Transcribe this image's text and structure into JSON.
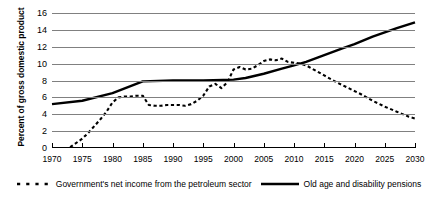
{
  "chart_data": {
    "type": "line",
    "title": "",
    "subtitle": "",
    "xlabel": "",
    "ylabel": "Percent of gross domestic product",
    "xlim": [
      1970,
      2030
    ],
    "ylim": [
      0,
      16
    ],
    "ytick_step": 2,
    "xtick_step": 5,
    "grid": true,
    "grid_axis": "y",
    "legend_position": "bottom",
    "xticks": [
      1970,
      1975,
      1980,
      1985,
      1990,
      1995,
      2000,
      2005,
      2010,
      2015,
      2020,
      2025,
      2030
    ],
    "yticks": [
      0,
      2,
      4,
      6,
      8,
      10,
      12,
      14,
      16
    ],
    "series": [
      {
        "name": "Government's net income from the petroleum sector",
        "style": "dashed",
        "color": "#000000",
        "x": [
          1973,
          1975,
          1976,
          1977,
          1978,
          1979,
          1980,
          1981,
          1982,
          1983,
          1984,
          1985,
          1986,
          1987,
          1988,
          1989,
          1990,
          1991,
          1992,
          1993,
          1994,
          1995,
          1996,
          1997,
          1998,
          1999,
          2000,
          2001,
          2002,
          2003,
          2004,
          2005,
          2006,
          2007,
          2008,
          2009,
          2010,
          2011,
          2012,
          2013,
          2015,
          2017,
          2019,
          2021,
          2023,
          2025,
          2027,
          2029,
          2030
        ],
        "y": [
          0.1,
          1.1,
          1.8,
          2.6,
          3.4,
          4.3,
          5.4,
          6.0,
          6.1,
          6.1,
          6.2,
          6.2,
          5.1,
          5.0,
          5.0,
          5.1,
          5.1,
          5.1,
          5.0,
          5.2,
          5.6,
          6.2,
          7.3,
          7.6,
          7.1,
          7.8,
          9.3,
          9.6,
          9.3,
          9.4,
          9.8,
          10.3,
          10.5,
          10.4,
          10.6,
          10.2,
          10.1,
          10.0,
          9.8,
          9.4,
          8.6,
          7.8,
          7.1,
          6.4,
          5.6,
          4.9,
          4.3,
          3.7,
          3.5
        ]
      },
      {
        "name": "Old age and disability pensions",
        "style": "solid",
        "color": "#000000",
        "x": [
          1970,
          1975,
          1980,
          1985,
          1990,
          1995,
          2000,
          2002,
          2005,
          2008,
          2010,
          2012,
          2015,
          2018,
          2020,
          2023,
          2025,
          2027,
          2030
        ],
        "y": [
          5.2,
          5.6,
          6.5,
          7.9,
          8.0,
          8.0,
          8.1,
          8.3,
          8.8,
          9.4,
          9.8,
          10.2,
          11.0,
          11.8,
          12.3,
          13.2,
          13.7,
          14.2,
          14.9
        ]
      }
    ]
  },
  "legend": {
    "entries": [
      {
        "label": "Government's net income from the petroleum sector",
        "style": "dashed"
      },
      {
        "label": "Old age and disability pensions",
        "style": "solid"
      }
    ]
  }
}
